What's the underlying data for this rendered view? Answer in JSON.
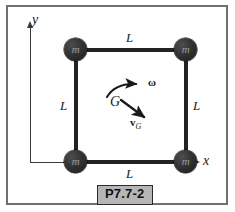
{
  "figure": {
    "problem_id": "P7.7-2",
    "axes": {
      "x_label": "x",
      "y_label": "y"
    },
    "masses": [
      {
        "name": "top-left",
        "label": "m"
      },
      {
        "name": "top-right",
        "label": "m"
      },
      {
        "name": "bottom-left",
        "label": "m"
      },
      {
        "name": "bottom-right",
        "label": "m"
      }
    ],
    "side_labels": {
      "top": "L",
      "bottom": "L",
      "left": "L",
      "right": "L"
    },
    "center": {
      "point_label": "G",
      "angular_velocity_label": "ω",
      "velocity_label_vector": "v",
      "velocity_label_subscript": "G"
    },
    "colors": {
      "frame_border": "#6f6f6f",
      "bar": "#232323",
      "mass_fill": "#1c1c1c",
      "mass_text": "#9d9d9d",
      "axis": "#3a3a3a",
      "plate_background": "#b6b6b6",
      "plate_border": "#2a2a2a",
      "text": "#1a1a1a"
    }
  }
}
